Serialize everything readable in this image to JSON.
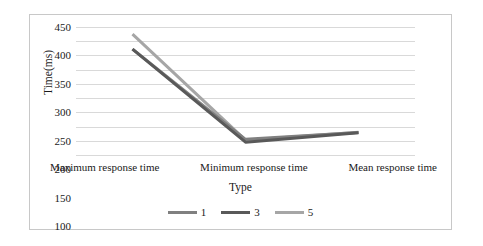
{
  "chart_data": {
    "type": "line",
    "title": "",
    "xlabel": "Type",
    "ylabel": "Time(ms)",
    "categories": [
      "Maximum response time",
      "Minimum response time",
      "Mean response time"
    ],
    "series": [
      {
        "name": "1",
        "values": [
          372,
          55,
          79
        ],
        "color": "#808080"
      },
      {
        "name": "3",
        "values": [
          372,
          45,
          78
        ],
        "color": "#595959"
      },
      {
        "name": "5",
        "values": [
          425,
          52,
          80
        ],
        "color": "#a6a6a6"
      }
    ],
    "ylim": [
      0,
      450
    ],
    "yticks": [
      450,
      400,
      350,
      300,
      250,
      200,
      150,
      100,
      50,
      0
    ],
    "grid": true,
    "legend_position": "bottom",
    "background": "#ffffff",
    "border_color": "#c8c8c8"
  },
  "axes": {
    "y_title": "Time(ms)",
    "x_title": "Type",
    "y_tick_labels": [
      "450",
      "400",
      "350",
      "300",
      "250",
      "200",
      "150",
      "100",
      "50",
      "0"
    ],
    "x_tick_labels": [
      "Maximum response time",
      "Minimum response time",
      "Mean response time"
    ]
  },
  "legend": {
    "items": [
      {
        "label": "1"
      },
      {
        "label": "3"
      },
      {
        "label": "5"
      }
    ]
  }
}
